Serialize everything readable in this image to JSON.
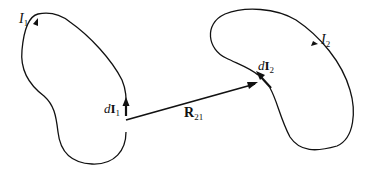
{
  "diagram": {
    "loop1": {
      "current_label": "I",
      "current_sub": "1",
      "element_label_d": "d",
      "element_label_I": "I",
      "element_sub": "1"
    },
    "loop2": {
      "current_label": "I",
      "current_sub": "2",
      "element_label_d": "d",
      "element_label_I": "I",
      "element_sub": "2"
    },
    "separation_vector": {
      "label": "R",
      "sub": "21"
    },
    "colors": {
      "line": "#111111",
      "background": "#ffffff"
    }
  }
}
